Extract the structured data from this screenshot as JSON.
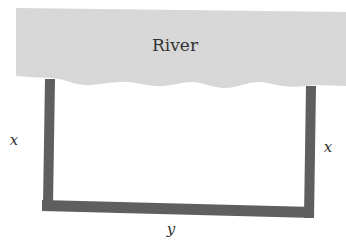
{
  "diagram": {
    "river_label": "River",
    "left_side_label": "x",
    "right_side_label": "x",
    "bottom_side_label": "y",
    "colors": {
      "river_fill": "#dcdcdc",
      "fence": "#5f5f5f",
      "text": "#333333",
      "background": "#ffffff"
    }
  }
}
